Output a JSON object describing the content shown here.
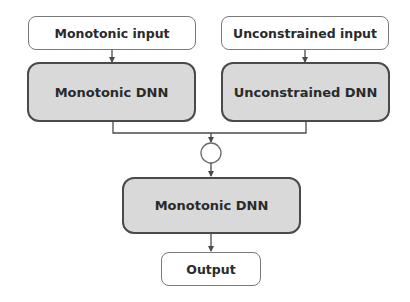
{
  "diagram": {
    "nodes": {
      "monotonic_input": {
        "label": "Monotonic input"
      },
      "unconstrained_input": {
        "label": "Unconstrained input"
      },
      "monotonic_dnn_top": {
        "label": "Monotonic DNN"
      },
      "unconstrained_dnn": {
        "label": "Unconstrained DNN"
      },
      "combine": {
        "label": ""
      },
      "monotonic_dnn_bottom": {
        "label": "Monotonic DNN"
      },
      "output": {
        "label": "Output"
      }
    },
    "edges": [
      {
        "from": "monotonic_input",
        "to": "monotonic_dnn_top"
      },
      {
        "from": "unconstrained_input",
        "to": "unconstrained_dnn"
      },
      {
        "from": "monotonic_dnn_top",
        "to": "combine"
      },
      {
        "from": "unconstrained_dnn",
        "to": "combine"
      },
      {
        "from": "combine",
        "to": "monotonic_dnn_bottom"
      },
      {
        "from": "monotonic_dnn_bottom",
        "to": "output"
      }
    ],
    "colors": {
      "dnn_fill": "#d9d9d9",
      "io_fill": "#ffffff",
      "stroke": "#4a4a4a"
    }
  }
}
